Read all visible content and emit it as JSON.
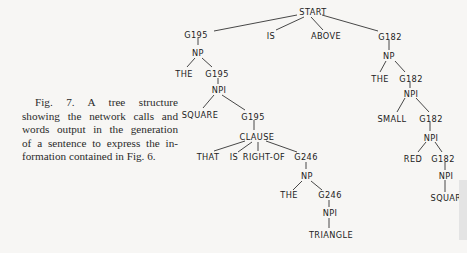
{
  "caption": {
    "lines": [
      "Fig. 7. A tree structure",
      "showing the network calls and",
      "words output in the generation",
      "of a sentence to express the in-",
      "formation contained in Fig. 6."
    ]
  },
  "tree": {
    "nodes": {
      "start": "START",
      "g195_a": "G195",
      "is": "IS",
      "above": "ABOVE",
      "g182_a": "G182",
      "np_a": "NP",
      "the_a": "THE",
      "g195_b": "G195",
      "npi_a": "NPI",
      "square_a": "SQUARE",
      "g195_c": "G195",
      "clause": "CLAUSE",
      "that": "THAT",
      "is_b": "IS",
      "right_of": "RIGHT-OF",
      "g246_a": "G246",
      "np_b": "NP",
      "the_b": "THE",
      "g246_b": "G246",
      "npi_b": "NPI",
      "triangle": "TRIANGLE",
      "np_c": "NP",
      "the_c": "THE",
      "g182_b": "G182",
      "npi_c": "NPI",
      "small": "SMALL",
      "g182_c": "G182",
      "npi_d": "NPI",
      "red": "RED",
      "g182_d": "G182",
      "npi_e": "NPI",
      "square_b": "SQUAR"
    }
  }
}
